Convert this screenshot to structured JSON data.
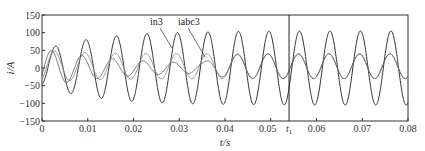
{
  "chart_data": {
    "type": "line",
    "title": "",
    "xlabel": "t/s",
    "ylabel": "i/A",
    "xlim": [
      0,
      0.08
    ],
    "ylim": [
      -150,
      150
    ],
    "xticks": [
      "0",
      "0.01",
      "0.02",
      "0.03",
      "0.04",
      "0.05",
      "0.06",
      "0.07",
      "0.08"
    ],
    "xtick_values": [
      0,
      0.01,
      0.02,
      0.03,
      0.04,
      0.05,
      0.06,
      0.07,
      0.08
    ],
    "yticks": [
      "150",
      "100",
      "50",
      "0",
      "-50",
      "-100",
      "-150"
    ],
    "ytick_values": [
      150,
      100,
      50,
      0,
      -50,
      -100,
      -150
    ],
    "grid": false,
    "legend": null,
    "frequency_hz": 150,
    "series": [
      {
        "name": "in3",
        "description": "large-amplitude 150 Hz current, grows to steady state ~100 A peak",
        "steady_amplitude": 100,
        "color": "#333333"
      },
      {
        "name": "iabc3",
        "description": "smaller-amplitude 150 Hz current, steady state ~35 A peak",
        "steady_amplitude": 35,
        "offset": 5,
        "color": "#888888"
      },
      {
        "name": "transient",
        "description": "third trace visible only during start-up transient (t<0.03s)",
        "color": "#555555"
      }
    ],
    "annotations": [
      {
        "text": "in3",
        "x": 0.021,
        "y": 118
      },
      {
        "text": "iabc3",
        "x": 0.03,
        "y": 118
      },
      {
        "text": "t1",
        "x": 0.054,
        "type": "vertical-line"
      }
    ]
  }
}
